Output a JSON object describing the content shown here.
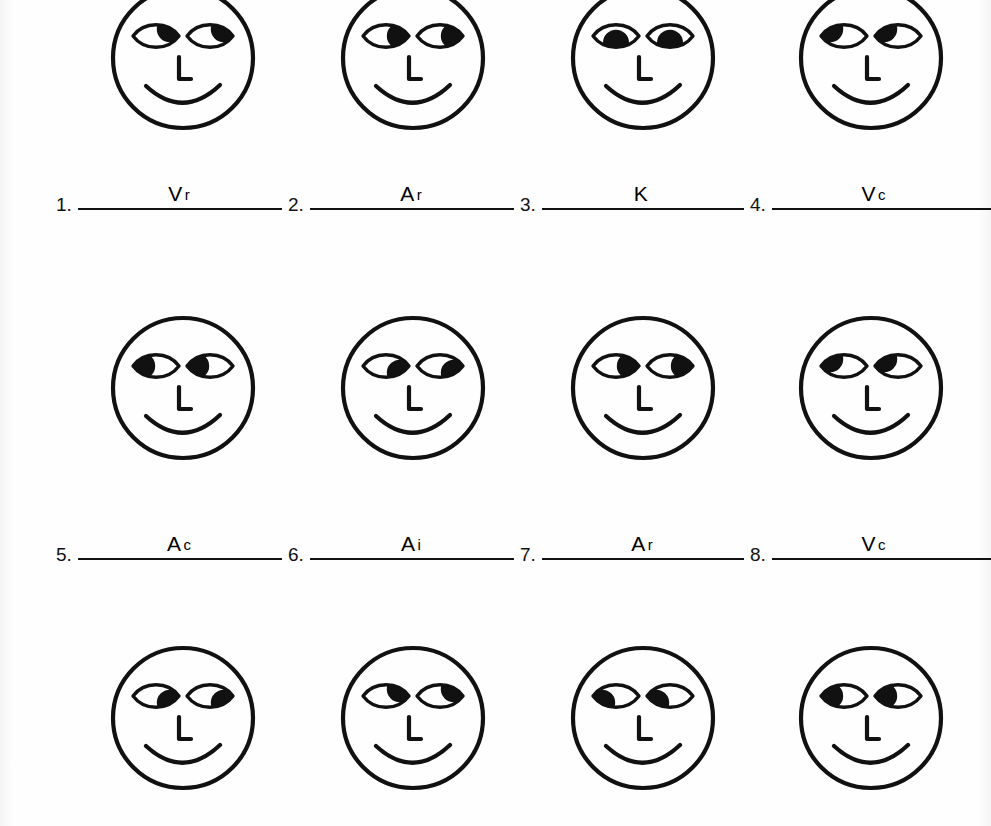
{
  "document": {
    "kind": "worksheet",
    "title": "Eye Accessing Cues Practice Sheet",
    "ink_color": "#111111",
    "paper_color": "#fefefe",
    "rows": 3,
    "columns": 4
  },
  "faces": [
    {
      "id": 1,
      "row": 1,
      "column": 1,
      "gaze": "up-right",
      "pupil_x": "right",
      "pupil_y": "up",
      "nose": "L",
      "mouth": "smile"
    },
    {
      "id": 2,
      "row": 1,
      "column": 2,
      "gaze": "right",
      "pupil_x": "right",
      "pupil_y": "center",
      "nose": "L",
      "mouth": "smile"
    },
    {
      "id": 3,
      "row": 1,
      "column": 3,
      "gaze": "down",
      "pupil_x": "center",
      "pupil_y": "down",
      "nose": "L",
      "mouth": "smile"
    },
    {
      "id": 4,
      "row": 1,
      "column": 4,
      "gaze": "up-left",
      "pupil_x": "left",
      "pupil_y": "up",
      "nose": "L",
      "mouth": "smile"
    },
    {
      "id": 5,
      "row": 2,
      "column": 1,
      "gaze": "left",
      "pupil_x": "left",
      "pupil_y": "center",
      "nose": "L",
      "mouth": "smile"
    },
    {
      "id": 6,
      "row": 2,
      "column": 2,
      "gaze": "down-right",
      "pupil_x": "right",
      "pupil_y": "down",
      "nose": "L",
      "mouth": "smile"
    },
    {
      "id": 7,
      "row": 2,
      "column": 3,
      "gaze": "right",
      "pupil_x": "right",
      "pupil_y": "center",
      "nose": "L",
      "mouth": "smile"
    },
    {
      "id": 8,
      "row": 2,
      "column": 4,
      "gaze": "up-left",
      "pupil_x": "left",
      "pupil_y": "up",
      "nose": "L",
      "mouth": "smile"
    },
    {
      "id": 9,
      "row": 3,
      "column": 1,
      "gaze": "down-right",
      "pupil_x": "right",
      "pupil_y": "down",
      "nose": "L",
      "mouth": "smile"
    },
    {
      "id": 10,
      "row": 3,
      "column": 2,
      "gaze": "up-right",
      "pupil_x": "right",
      "pupil_y": "up",
      "nose": "L",
      "mouth": "smile"
    },
    {
      "id": 11,
      "row": 3,
      "column": 3,
      "gaze": "down-left",
      "pupil_x": "left",
      "pupil_y": "down",
      "nose": "L",
      "mouth": "smile"
    },
    {
      "id": 12,
      "row": 3,
      "column": 4,
      "gaze": "left",
      "pupil_x": "left",
      "pupil_y": "center",
      "nose": "L",
      "mouth": "smile"
    }
  ],
  "answer_rows": [
    {
      "row": 1,
      "slots": [
        {
          "number": "1.",
          "answer_main": "V",
          "answer_sup": "r"
        },
        {
          "number": "2.",
          "answer_main": "A",
          "answer_sup": "r"
        },
        {
          "number": "3.",
          "answer_main": "K",
          "answer_sup": ""
        },
        {
          "number": "4.",
          "answer_main": "V",
          "answer_sup": "c"
        }
      ]
    },
    {
      "row": 2,
      "slots": [
        {
          "number": "5.",
          "answer_main": "A",
          "answer_sup": "c"
        },
        {
          "number": "6.",
          "answer_main": "A",
          "answer_sup": "i"
        },
        {
          "number": "7.",
          "answer_main": "A",
          "answer_sup": "r"
        },
        {
          "number": "8.",
          "answer_main": "V",
          "answer_sup": "c"
        }
      ]
    }
  ]
}
